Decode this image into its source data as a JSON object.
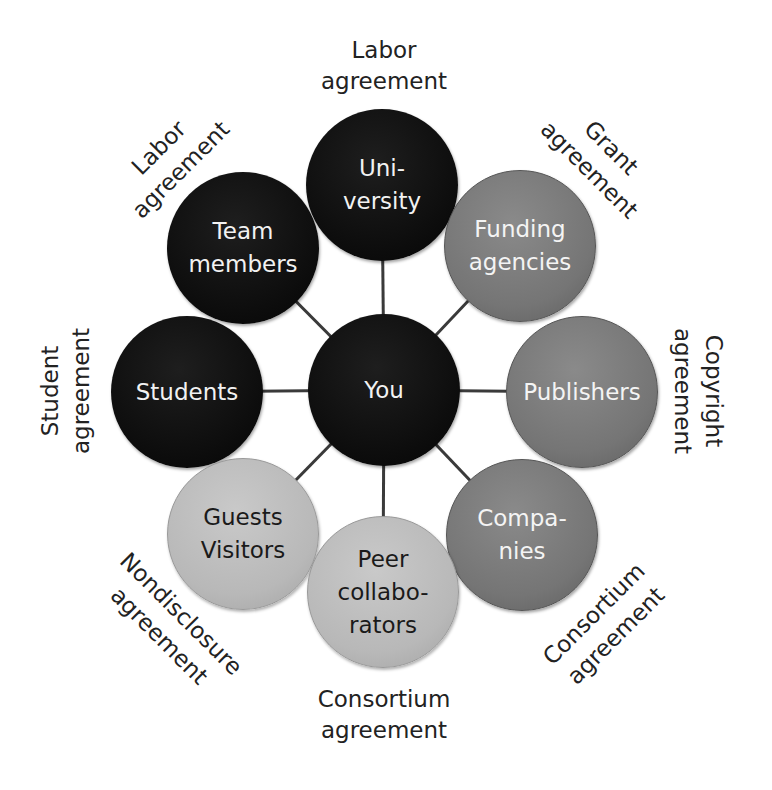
{
  "center": {
    "label": "You",
    "tone": "dark"
  },
  "nodes": {
    "university": {
      "label": "Uni-\nversity",
      "tone": "dark",
      "agreement": "Labor\nagreement"
    },
    "team_members": {
      "label": "Team\nmembers",
      "tone": "dark",
      "agreement": "Labor\nagreement"
    },
    "funding_agencies": {
      "label": "Funding\nagencies",
      "tone": "mid",
      "agreement": "Grant\nagreement"
    },
    "students": {
      "label": "Students",
      "tone": "dark",
      "agreement": "Student\nagreement"
    },
    "publishers": {
      "label": "Publishers",
      "tone": "mid",
      "agreement": "Copyright\nagreement"
    },
    "guests_visitors": {
      "label": "Guests\nVisitors",
      "tone": "light",
      "agreement": "Nondisclosure\nagreement"
    },
    "companies": {
      "label": "Compa-\nnies",
      "tone": "mid",
      "agreement": "Consortium\nagreement"
    },
    "peer_collaborators": {
      "label": "Peer\ncollabo-\nrators",
      "tone": "light",
      "agreement": "Consortium\nagreement"
    }
  },
  "colors": {
    "dark": "#0c0c0c",
    "mid": "#787878",
    "light": "#bdbdbd",
    "connector": "#3a3a3a",
    "label_text": "#222222"
  }
}
